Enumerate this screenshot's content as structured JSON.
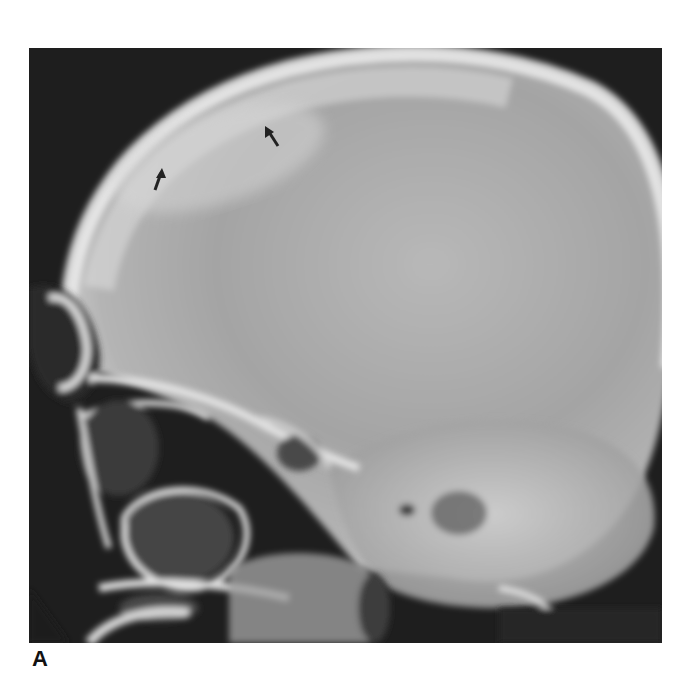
{
  "figure": {
    "panel_label": "A",
    "annotations": [
      {
        "type": "arrow",
        "icon": "arrow-up-icon",
        "x": 158,
        "y": 180
      },
      {
        "type": "arrow",
        "icon": "arrow-up-left-icon",
        "x": 272,
        "y": 138
      }
    ],
    "colors": {
      "background": "#1e1e1e",
      "bone_bright": "#e8e8e8",
      "skull_fill": "#a9a9a9",
      "arrow": "#222222"
    }
  }
}
